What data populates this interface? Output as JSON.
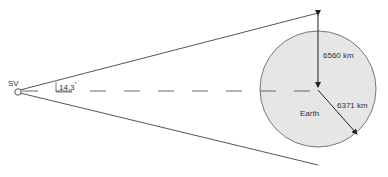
{
  "diagram": {
    "observer_label": "SV",
    "angle_label": "14.3",
    "angle_unit": "°",
    "earth_label": "Earth",
    "distance_label": "6560 km",
    "radius_label": "6371 km"
  },
  "colors": {
    "line": "#555555",
    "earth_fill": "#e6e6e6",
    "earth_stroke": "#777777",
    "text": "#333333"
  }
}
